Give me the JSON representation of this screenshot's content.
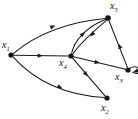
{
  "figure": {
    "kind": "directed-graph-diagram",
    "width": 138,
    "height": 119,
    "background_color": "#ffffff",
    "ink_color": "#1a1a1a"
  },
  "nodes": [
    {
      "id": "x1",
      "label_base": "x",
      "label_sub": "1",
      "cx": 11,
      "cy": 55,
      "r": 2.6,
      "label_x": 2,
      "label_y": 40
    },
    {
      "id": "x2",
      "label_base": "x",
      "label_sub": "2",
      "cx": 107,
      "cy": 98,
      "r": 2.6,
      "label_x": 101,
      "label_y": 103
    },
    {
      "id": "x3",
      "label_base": "x",
      "label_sub": "3",
      "cx": 128,
      "cy": 70,
      "r": 2.6,
      "label_x": 115,
      "label_y": 72
    },
    {
      "id": "x4",
      "label_base": "x",
      "label_sub": "4",
      "cx": 71,
      "cy": 56,
      "r": 2.6,
      "label_x": 59,
      "label_y": 58
    },
    {
      "id": "x5",
      "label_base": "x",
      "label_sub": "5",
      "cx": 108,
      "cy": 18,
      "r": 2.8,
      "label_x": 110,
      "label_y": 1
    }
  ],
  "edges": [
    {
      "id": "e1",
      "from": "x1",
      "to": "x5",
      "style": "curved-up",
      "path": "M 13.3 53.6 C 38 33 68 22 105.3 18.6",
      "arrow_x": 55.5,
      "arrow_y": 25.6,
      "arrow_angle": -21
    },
    {
      "id": "e2",
      "from": "x1",
      "to": "x4",
      "style": "straight",
      "path": "M 13.6 55.3 L 68.4 56.0",
      "arrow_x": 43.0,
      "arrow_y": 55.7,
      "arrow_angle": 1
    },
    {
      "id": "e3",
      "from": "x1",
      "to": "x2",
      "style": "curved-down",
      "path": "M 13.2 57.2 C 33 79 62 95 104.3 97.6",
      "arrow_x": 62.5,
      "arrow_y": 88.5,
      "arrow_angle": 26
    },
    {
      "id": "e4",
      "from": "x4",
      "to": "x5",
      "style": "curved-left",
      "path": "M 71.6 53.5 C 74 41 86 27 105.4 19.5",
      "arrow_x": 85.0,
      "arrow_y": 32.0,
      "arrow_angle": -44
    },
    {
      "id": "e5",
      "from": "x5",
      "to": "x4",
      "style": "curved-right",
      "path": "M 106.4 20.3 C 95 30 80 43 72.8 54.0",
      "arrow_x": 90.0,
      "arrow_y": 36.5,
      "arrow_angle": 136
    },
    {
      "id": "e6",
      "from": "x4",
      "to": "x3",
      "style": "straight",
      "path": "M 73.5 56.8 L 125.6 69.3",
      "arrow_x": 100.0,
      "arrow_y": 63.0,
      "arrow_angle": 13
    },
    {
      "id": "e7",
      "from": "x4",
      "to": "x2",
      "style": "straight",
      "path": "M 72.6 58.2 L 105.2 96.2",
      "arrow_x": 88.0,
      "arrow_y": 76.5,
      "arrow_angle": 49
    },
    {
      "id": "e8",
      "from": "x3",
      "to": "x5",
      "style": "straight",
      "path": "M 127.4 67.4 L 109.0 20.7",
      "arrow_x": 118.5,
      "arrow_y": 43.5,
      "arrow_angle": -111
    },
    {
      "id": "e9",
      "from": "x3",
      "to": "x3",
      "style": "self-loop",
      "path": "M 129.8 68.3 C 140 62 146 78 132.5 72.3",
      "arrow_x": 133.0,
      "arrow_y": 72.2,
      "arrow_angle": 160
    }
  ]
}
